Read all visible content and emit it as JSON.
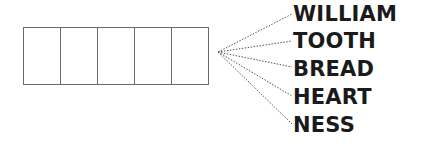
{
  "diagram": {
    "box_count": 5,
    "words": [
      "WILLIAM",
      "TOOTH",
      "BREAD",
      "HEART",
      "NESS"
    ],
    "line_style": "dotted",
    "colors": {
      "box_border": "#6a6a6a",
      "text": "#1a1a1a",
      "line": "#555555"
    }
  }
}
